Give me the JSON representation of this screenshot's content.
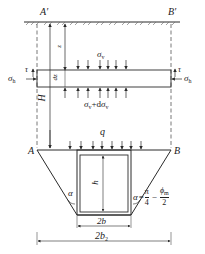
{
  "figure": {
    "points": {
      "A_prime": "A′",
      "B_prime": "B′",
      "A": "A",
      "B": "B"
    },
    "depth_label": "z",
    "thickness_label": "dz",
    "height_total_label": "H",
    "stress": {
      "vertical_top": "σv",
      "vertical_top_main": "σ",
      "vertical_top_sub": "v",
      "vertical_bottom_main": "σ",
      "vertical_bottom_sub": "v",
      "vertical_bottom_plus": "+d",
      "vertical_bottom_main2": "σ",
      "vertical_bottom_sub2": "v",
      "horizontal_main": "σ",
      "horizontal_sub": "h",
      "shear": "τ"
    },
    "load_label": "q",
    "box_height_label": "h",
    "box_width_label": "2b",
    "trench_width_main": "2b",
    "trench_width_sub": "2",
    "angle_left": "α",
    "angle_right": "α",
    "angle_formula": {
      "equals": "=",
      "pi": "π",
      "four": "4",
      "minus": "−",
      "phi_main": "ϕ",
      "phi_sub": "m",
      "two": "2"
    }
  },
  "colors": {
    "line": "#2a2a2a",
    "ground_hatch": "#555555",
    "background": "#ffffff"
  }
}
